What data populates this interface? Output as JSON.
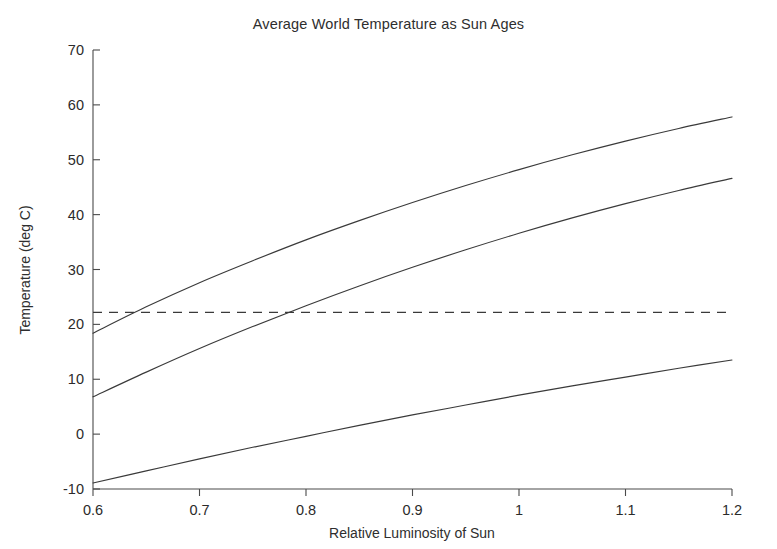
{
  "chart_data": {
    "type": "line",
    "title": "Average World Temperature as Sun Ages",
    "xlabel": "Relative Luminosity of Sun",
    "ylabel": "Temperature (deg C)",
    "xlim": [
      0.6,
      1.2
    ],
    "ylim": [
      -10,
      70
    ],
    "xticks": [
      0.6,
      0.7,
      0.8,
      0.9,
      1.0,
      1.1,
      1.2
    ],
    "xtick_labels": [
      "0.6",
      "0.7",
      "0.8",
      "0.9",
      "1",
      "1.1",
      "1.2"
    ],
    "yticks": [
      -10,
      0,
      10,
      20,
      30,
      40,
      50,
      60,
      70
    ],
    "ytick_labels": [
      "-10",
      "0",
      "10",
      "20",
      "30",
      "40",
      "50",
      "60",
      "70"
    ],
    "grid": false,
    "legend": "none",
    "x": [
      0.6,
      0.65,
      0.7,
      0.75,
      0.8,
      0.85,
      0.9,
      0.95,
      1.0,
      1.05,
      1.1,
      1.15,
      1.2
    ],
    "series": [
      {
        "name": "upper-curve",
        "values": [
          18.4,
          23.2,
          27.6,
          31.6,
          35.4,
          38.9,
          42.2,
          45.3,
          48.2,
          50.9,
          53.4,
          55.7,
          57.8
        ]
      },
      {
        "name": "middle-curve",
        "values": [
          6.8,
          11.3,
          15.6,
          19.6,
          23.4,
          27.0,
          30.4,
          33.6,
          36.6,
          39.4,
          42.0,
          44.4,
          46.6
        ]
      },
      {
        "name": "lower-curve",
        "values": [
          -8.9,
          -6.7,
          -4.5,
          -2.4,
          -0.4,
          1.6,
          3.5,
          5.3,
          7.1,
          8.8,
          10.4,
          12.0,
          13.5
        ]
      }
    ],
    "threshold_line": {
      "name": "present-day-average",
      "value": 22.2,
      "style": "dashed",
      "orientation": "horizontal"
    },
    "threshold_crossings": [
      {
        "series": "upper-curve",
        "x": 0.63
      },
      {
        "series": "middle-curve",
        "x": 0.75
      },
      {
        "series": "lower-curve",
        "x": 1.06
      }
    ]
  }
}
